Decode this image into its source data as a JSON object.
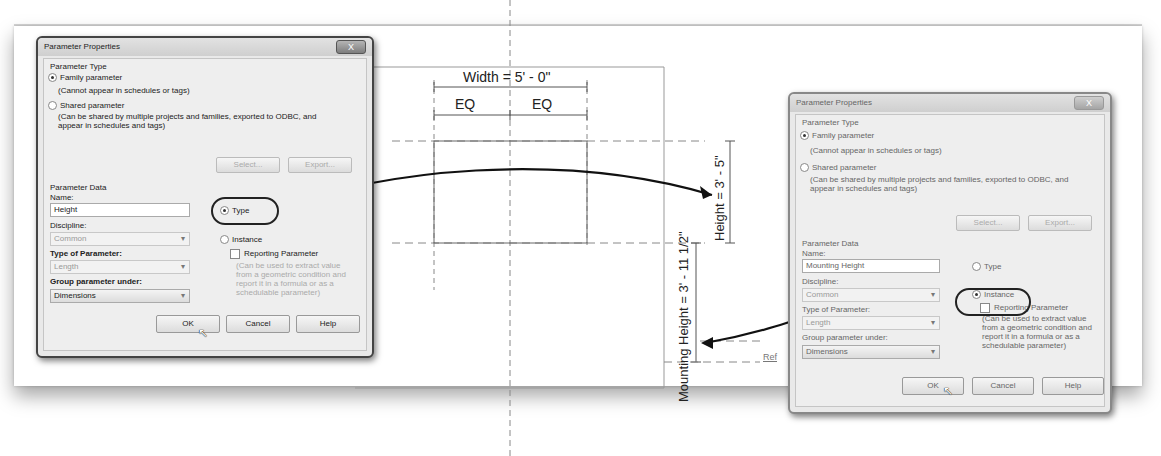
{
  "drawing": {
    "width_dim": "Width = 5' - 0\"",
    "eq_left": "EQ",
    "eq_right": "EQ",
    "height_dim": "Height = 3' - 5\"",
    "mounting_height_dim": "Mounting Height = 3' - 11 1/2\"",
    "ref_label": "Ref"
  },
  "dialog_left": {
    "title": "Parameter Properties",
    "close_label": "X",
    "parameter_type_header": "Parameter Type",
    "family_parameter": "Family parameter",
    "family_note": "(Cannot appear in schedules or tags)",
    "shared_parameter": "Shared parameter",
    "shared_note_1": "(Can be shared by multiple projects and families, exported to ODBC, and",
    "shared_note_2": "appear in schedules and tags)",
    "select_button": "Select...",
    "export_button": "Export...",
    "parameter_data_header": "Parameter Data",
    "name_label": "Name:",
    "name_value": "Height",
    "type_radio": "Type",
    "instance_radio": "Instance",
    "discipline_label": "Discipline:",
    "discipline_value": "Common",
    "type_of_param_label": "Type of Parameter:",
    "type_of_param_value": "Length",
    "group_label": "Group parameter under:",
    "group_value": "Dimensions",
    "reporting_label": "Reporting Parameter",
    "reporting_note_1": "(Can be used to extract value",
    "reporting_note_2": "from a geometric condition and",
    "reporting_note_3": "report it in a formula or as a",
    "reporting_note_4": "schedulable parameter)",
    "ok_button": "OK",
    "cancel_button": "Cancel",
    "help_button": "Help",
    "selected_scope": "Type"
  },
  "dialog_right": {
    "title": "Parameter Properties",
    "close_label": "X",
    "parameter_type_header": "Parameter Type",
    "family_parameter": "Family parameter",
    "family_note": "(Cannot appear in schedules or tags)",
    "shared_parameter": "Shared parameter",
    "shared_note_1": "(Can be shared by multiple projects and families, exported to ODBC, and",
    "shared_note_2": "appear in schedules and tags)",
    "select_button": "Select...",
    "export_button": "Export...",
    "parameter_data_header": "Parameter Data",
    "name_label": "Name:",
    "name_value": "Mounting Height",
    "type_radio": "Type",
    "instance_radio": "Instance",
    "discipline_label": "Discipline:",
    "discipline_value": "Common",
    "type_of_param_label": "Type of Parameter:",
    "type_of_param_value": "Length",
    "group_label": "Group parameter under:",
    "group_value": "Dimensions",
    "reporting_label": "Reporting Parameter",
    "reporting_note_1": "(Can be used to extract value",
    "reporting_note_2": "from a geometric condition and",
    "reporting_note_3": "report it in a formula or as a",
    "reporting_note_4": "schedulable parameter)",
    "ok_button": "OK",
    "cancel_button": "Cancel",
    "help_button": "Help",
    "selected_scope": "Instance"
  }
}
